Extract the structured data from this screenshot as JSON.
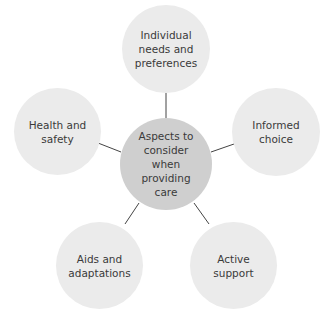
{
  "diagram": {
    "colors": {
      "outer_fill": "#ebebeb",
      "center_fill": "#cfcfcf",
      "line": "#444444",
      "text": "#3a3a3a"
    },
    "center": {
      "label": "Aspects to\nconsider when\nproviding\ncare"
    },
    "nodes": [
      {
        "id": "top",
        "label": "Individual\nneeds and\npreferences"
      },
      {
        "id": "right",
        "label": "Informed\nchoice"
      },
      {
        "id": "bottom-right",
        "label": "Active\nsupport"
      },
      {
        "id": "bottom-left",
        "label": "Aids and\nadaptations"
      },
      {
        "id": "left",
        "label": "Health and\nsafety"
      }
    ]
  }
}
